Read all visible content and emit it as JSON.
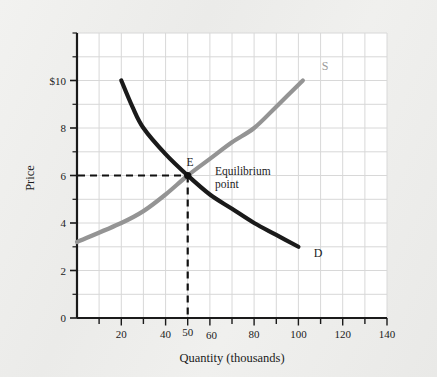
{
  "figure": {
    "name": "supply-and-demand-equilibrium-chart",
    "background_color": "#eeeeec",
    "plot_background_color": "#ffffff"
  },
  "axes": {
    "x": {
      "title": "Quantity (thousands)",
      "tick_labels": [
        "20",
        "40",
        "50",
        "60",
        "80",
        "100",
        "120",
        "140"
      ],
      "tick_values": [
        20,
        40,
        50,
        60,
        80,
        100,
        120,
        140
      ],
      "range": [
        0,
        140
      ],
      "minor_tick_step": 10
    },
    "y": {
      "title": "Price",
      "tick_labels": [
        "0",
        "2",
        "4",
        "6",
        "8",
        "$10"
      ],
      "tick_values": [
        0,
        2,
        4,
        6,
        8,
        10
      ],
      "range": [
        0,
        12
      ],
      "minor_tick_step": 1
    }
  },
  "labels": {
    "supply_curve": "S",
    "demand_curve": "D",
    "equilibrium_marker": "E",
    "annotation_line_1": "Equilibrium",
    "annotation_line_2": "point"
  },
  "colors": {
    "supply": "#949494",
    "demand": "#1a1a1a",
    "grid": "#d8d8d8",
    "axis": "#1a1a1a",
    "dashed": "#111111"
  },
  "chart_data": {
    "type": "line",
    "title": "",
    "xlabel": "Quantity (thousands)",
    "ylabel": "Price",
    "xlim": [
      0,
      140
    ],
    "ylim": [
      0,
      12
    ],
    "grid": true,
    "legend": "inline-curve-labels",
    "series": [
      {
        "name": "D",
        "label": "Demand",
        "color": "#1a1a1a",
        "points": [
          {
            "q": 20,
            "p": 10.0
          },
          {
            "q": 25,
            "p": 8.9
          },
          {
            "q": 30,
            "p": 8.0
          },
          {
            "q": 40,
            "p": 6.9
          },
          {
            "q": 50,
            "p": 6.0
          },
          {
            "q": 60,
            "p": 5.2
          },
          {
            "q": 70,
            "p": 4.6
          },
          {
            "q": 80,
            "p": 4.0
          },
          {
            "q": 90,
            "p": 3.5
          },
          {
            "q": 100,
            "p": 3.0
          }
        ]
      },
      {
        "name": "S",
        "label": "Supply",
        "color": "#949494",
        "points": [
          {
            "q": 0,
            "p": 3.2
          },
          {
            "q": 20,
            "p": 4.0
          },
          {
            "q": 30,
            "p": 4.5
          },
          {
            "q": 40,
            "p": 5.2
          },
          {
            "q": 50,
            "p": 6.0
          },
          {
            "q": 60,
            "p": 6.7
          },
          {
            "q": 70,
            "p": 7.4
          },
          {
            "q": 80,
            "p": 8.0
          },
          {
            "q": 90,
            "p": 8.9
          },
          {
            "q": 102,
            "p": 10.0
          }
        ]
      }
    ],
    "annotations": [
      {
        "name": "equilibrium-point",
        "label": "E",
        "text": "Equilibrium point",
        "q": 50,
        "p": 6,
        "guides": [
          "horizontal-dashed-to-y-axis",
          "vertical-dashed-to-x-axis"
        ]
      }
    ]
  }
}
